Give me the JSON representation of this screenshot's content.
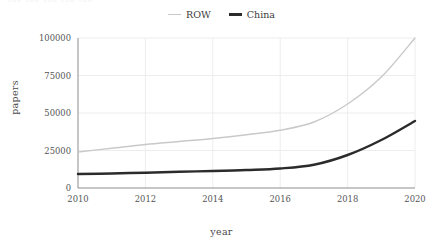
{
  "figure": {
    "top_clipped_text": "the the the the the"
  },
  "legend": {
    "position": "top-center",
    "entries": [
      {
        "label": "ROW",
        "color": "#c9c9c9",
        "linewidth": "thin",
        "swatch": "row-sw"
      },
      {
        "label": "China",
        "color": "#2b2b2b",
        "linewidth": "thick",
        "swatch": "china-sw"
      }
    ]
  },
  "axes": {
    "xlabel": "year",
    "ylabel": "papers",
    "xticks": [
      "2010",
      "2012",
      "2014",
      "2016",
      "2018",
      "2020"
    ],
    "yticks": [
      "0",
      "25000",
      "50000",
      "75000",
      "100000"
    ]
  },
  "chart_data": {
    "type": "line",
    "title": "",
    "xlabel": "year",
    "ylabel": "papers",
    "xlim": [
      2010,
      2020
    ],
    "ylim": [
      0,
      100000
    ],
    "xticks": [
      2010,
      2012,
      2014,
      2016,
      2018,
      2020
    ],
    "yticks": [
      0,
      25000,
      50000,
      75000,
      100000
    ],
    "grid": true,
    "legend_position": "top-center",
    "x": [
      2010,
      2011,
      2012,
      2013,
      2014,
      2015,
      2016,
      2017,
      2018,
      2019,
      2020
    ],
    "series": [
      {
        "name": "ROW",
        "color": "#c9c9c9",
        "values": [
          24000,
          26500,
          29000,
          31000,
          33000,
          35500,
          38500,
          44000,
          56000,
          74000,
          100000
        ]
      },
      {
        "name": "China",
        "color": "#2b2b2b",
        "values": [
          9300,
          9700,
          10200,
          10800,
          11300,
          12000,
          13000,
          15500,
          22000,
          32000,
          44700
        ]
      }
    ]
  }
}
